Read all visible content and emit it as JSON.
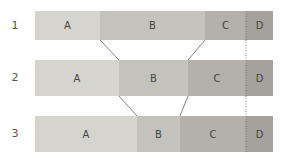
{
  "rows": [
    {
      "label": "1",
      "segments": [
        {
          "label": "A",
          "start": 35,
          "end": 100,
          "color": "#d6d4cf"
        },
        {
          "label": "B",
          "start": 100,
          "end": 205,
          "color": "#c4c2bc"
        },
        {
          "label": "C",
          "start": 205,
          "end": 246,
          "color": "#b4b1ab"
        },
        {
          "label": "D",
          "start": 246,
          "end": 273,
          "color": "#a5a29c"
        }
      ]
    },
    {
      "label": "2",
      "segments": [
        {
          "label": "A",
          "start": 35,
          "end": 119,
          "color": "#d6d4cf"
        },
        {
          "label": "B",
          "start": 119,
          "end": 188,
          "color": "#c4c2bc"
        },
        {
          "label": "C",
          "start": 188,
          "end": 246,
          "color": "#b4b1ab"
        },
        {
          "label": "D",
          "start": 246,
          "end": 273,
          "color": "#a5a29c"
        }
      ]
    },
    {
      "label": "3",
      "segments": [
        {
          "label": "A",
          "start": 35,
          "end": 137,
          "color": "#d6d4cf"
        },
        {
          "label": "B",
          "start": 137,
          "end": 180,
          "color": "#c4c2bc"
        },
        {
          "label": "C",
          "start": 180,
          "end": 246,
          "color": "#b4b1ab"
        },
        {
          "label": "D",
          "start": 246,
          "end": 273,
          "color": "#a5a29c"
        }
      ]
    }
  ]
}
